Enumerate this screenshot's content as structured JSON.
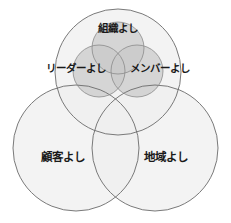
{
  "diagram": {
    "type": "venn",
    "title": "",
    "colors": {
      "background": "#ffffff",
      "outer_fill": "#efefef",
      "outer_overlap_fill": "#e3e3e3",
      "outer_stroke": "#6b6b6b",
      "inner_fill": "#c9c9c9",
      "inner_overlap_fill": "#b0b0b0",
      "inner_stroke": "#8a8a8a",
      "label_color": "#1a1a1a"
    },
    "outer_sets": [
      {
        "id": "organization-top",
        "label": "",
        "cx": 118,
        "cy": 72,
        "r": 63
      },
      {
        "id": "customer",
        "label": "顧客よし",
        "cx": 76,
        "cy": 148,
        "r": 63,
        "label_x": 63,
        "label_y": 157
      },
      {
        "id": "region",
        "label": "地域よし",
        "cx": 155,
        "cy": 148,
        "r": 63,
        "label_x": 166,
        "label_y": 157
      }
    ],
    "inner_sets": [
      {
        "id": "organization",
        "label": "組織よし",
        "cx": 118,
        "cy": 48,
        "r": 26,
        "label_x": 118,
        "label_y": 29
      },
      {
        "id": "leader",
        "label": "リーダーよし",
        "cx": 99,
        "cy": 71,
        "r": 26,
        "label_x": 76,
        "label_y": 69
      },
      {
        "id": "member",
        "label": "メンバーよし",
        "cx": 137,
        "cy": 71,
        "r": 26,
        "label_x": 160,
        "label_y": 69
      }
    ]
  }
}
